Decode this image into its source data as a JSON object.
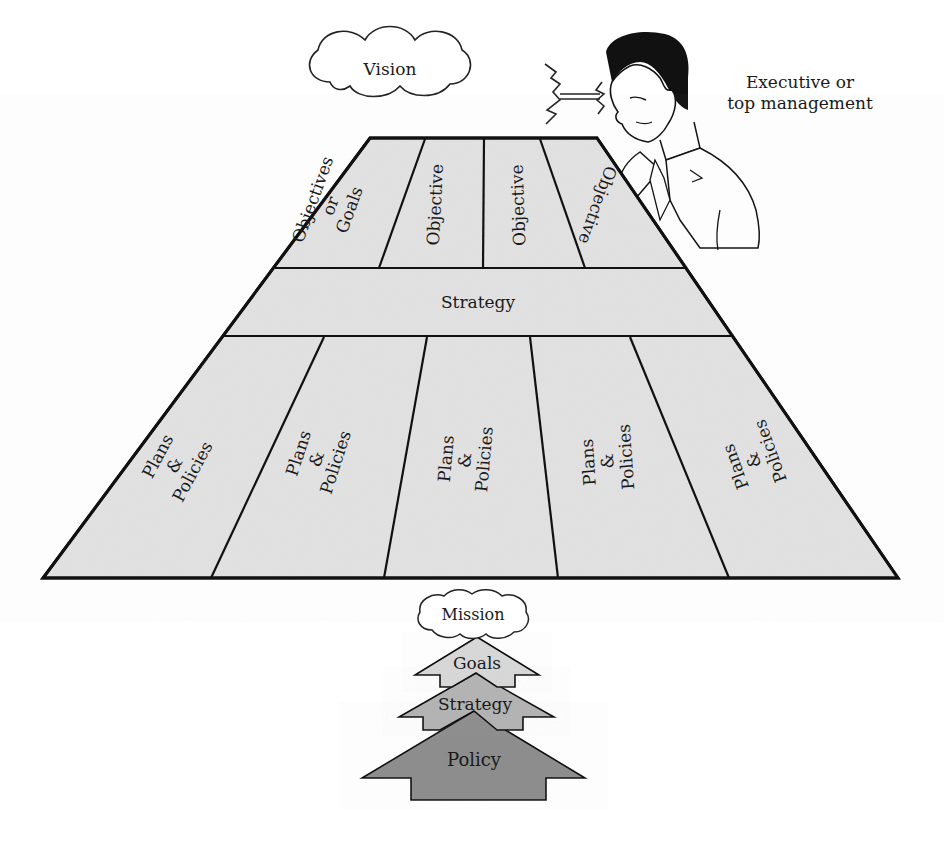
{
  "diagram": {
    "vision_cloud": {
      "label": "Vision"
    },
    "executive": {
      "label_line1": "Executive or",
      "label_line2": "top management"
    },
    "platform": {
      "fill": "#e3e3e3",
      "stroke": "#111111",
      "objectives_row": [
        {
          "line1": "Objectives",
          "line2": "or",
          "line3": "Goals"
        },
        {
          "line1": "Objective"
        },
        {
          "line1": "Objective"
        },
        {
          "line1": "Objective"
        }
      ],
      "strategy_band": {
        "label": "Strategy"
      },
      "plans_row": [
        {
          "line1": "Plans",
          "line2": "&",
          "line3": "Policies"
        },
        {
          "line1": "Plans",
          "line2": "&",
          "line3": "Policies"
        },
        {
          "line1": "Plans",
          "line2": "&",
          "line3": "Policies"
        },
        {
          "line1": "Plans",
          "line2": "&",
          "line3": "Policies"
        },
        {
          "line1": "Plans",
          "line2": "&",
          "line3": "Policies"
        }
      ]
    },
    "hierarchy_stack": {
      "mission": {
        "label": "Mission"
      },
      "goals": {
        "label": "Goals",
        "color": "#d8d8d8"
      },
      "strategy": {
        "label": "Strategy",
        "color": "#b4b4b4"
      },
      "policy": {
        "label": "Policy",
        "color": "#8e8e8e"
      }
    }
  }
}
